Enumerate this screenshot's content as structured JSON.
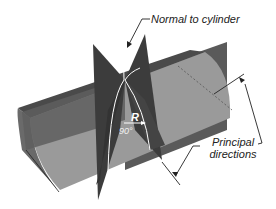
{
  "diagram": {
    "labels": {
      "normal": "Normal to cylinder",
      "principal_line1": "Principal",
      "principal_line2": "directions",
      "radius": "R",
      "angle": "90°"
    },
    "colors": {
      "cylinder_light": "#9a9a9a",
      "cylinder_mid": "#7a7a7a",
      "cylinder_dark": "#4a4a4a",
      "plane_dark": "#3c3c3c",
      "plane_mid": "#5a5a5a",
      "line": "#222222",
      "curve": "#ffffff"
    }
  }
}
